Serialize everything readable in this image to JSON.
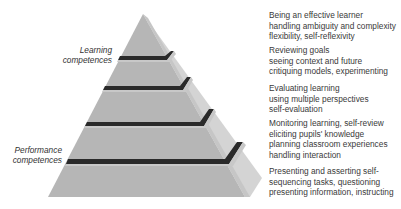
{
  "diagram": {
    "type": "pyramid",
    "colors": {
      "front_face": "#b4b4b4",
      "side_face": "#d2d2d2",
      "band": "#2a2a2a"
    },
    "side_labels": {
      "learning": [
        "Learning",
        "competences"
      ],
      "performance": [
        "Performance",
        "competences"
      ]
    },
    "tiers": [
      {
        "level": 5,
        "lines": [
          "Being an effective learner",
          "handling ambiguity and complexity",
          "flexibility, self-reflexivity"
        ]
      },
      {
        "level": 4,
        "lines": [
          "Reviewing goals",
          "seeing context and future",
          "critiquing models, experimenting"
        ]
      },
      {
        "level": 3,
        "lines": [
          "Evaluating learning",
          "using multiple perspectives",
          "self-evaluation"
        ]
      },
      {
        "level": 2,
        "lines": [
          "Monitoring learning, self-review",
          "eliciting pupils' knowledge",
          "planning classroom experiences",
          "handling interaction"
        ]
      },
      {
        "level": 1,
        "lines": [
          "Presenting and asserting self-",
          "sequencing tasks, questioning",
          "presenting information, instructing"
        ]
      }
    ]
  }
}
